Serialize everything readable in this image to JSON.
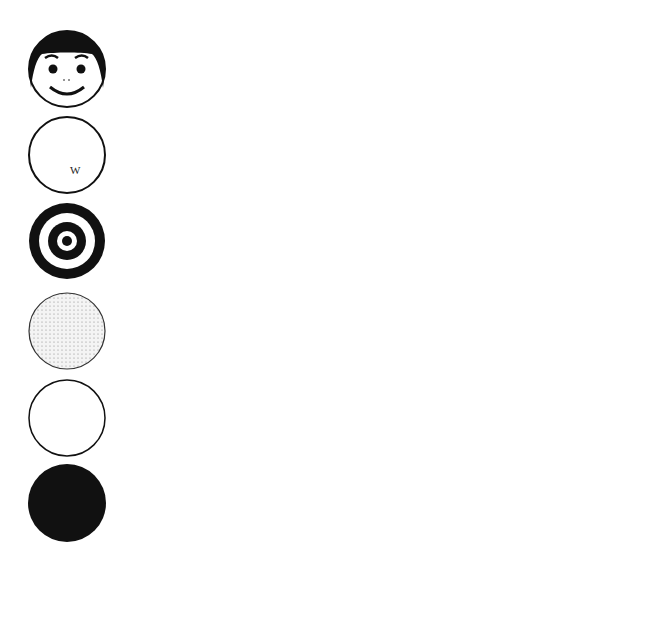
{
  "chart_data": {
    "type": "bar",
    "orientation": "horizontal",
    "title": "",
    "xlabel": "Percent of total fixation time",
    "ylabel": "",
    "xlim": [
      0,
      50
    ],
    "xticks": [
      0,
      10,
      20,
      30,
      40,
      50
    ],
    "grid": "vertical lines at each tick",
    "legend": "none (series distinguished by solid black vs. dotted fill)",
    "categories": [
      "face",
      "newsprint",
      "bullseye",
      "dotted",
      "white",
      "black"
    ],
    "category_icons": [
      "face-icon",
      "newsprint-icon",
      "bullseye-icon",
      "dotted-circle-icon",
      "white-circle-icon",
      "black-circle-icon"
    ],
    "series": [
      {
        "name": "solid",
        "fill": "#1a1a1a",
        "values": [
          41.4,
          19.7,
          18.6,
          9.3,
          5.8,
          7.5
        ]
      },
      {
        "name": "dotted",
        "fill": "#e8e8e8",
        "values": [
          33.4,
          20.1,
          18.7,
          10.6,
          10.6,
          9.2
        ]
      }
    ]
  },
  "axis": {
    "tick_labels": [
      "0",
      "10",
      "20",
      "30",
      "40",
      "50"
    ],
    "label": "Percent of total fixation time"
  }
}
